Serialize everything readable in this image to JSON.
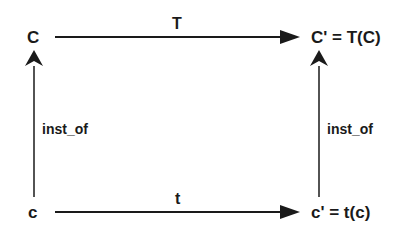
{
  "diagram": {
    "type": "commutative-square",
    "nodes": {
      "top_left": "C",
      "top_right": "C' = T(C)",
      "bottom_left": "c",
      "bottom_right": "c' = t(c)"
    },
    "edges": {
      "top": {
        "from": "C",
        "to": "C' = T(C)",
        "label": "T"
      },
      "bottom": {
        "from": "c",
        "to": "c' = t(c)",
        "label": "t"
      },
      "left": {
        "from": "c",
        "to": "C",
        "label": "inst_of"
      },
      "right": {
        "from": "c' = t(c)",
        "to": "C' = T(C)",
        "label": "inst_of"
      }
    },
    "colors": {
      "stroke": "#1a1a1a",
      "background": "#ffffff"
    }
  }
}
